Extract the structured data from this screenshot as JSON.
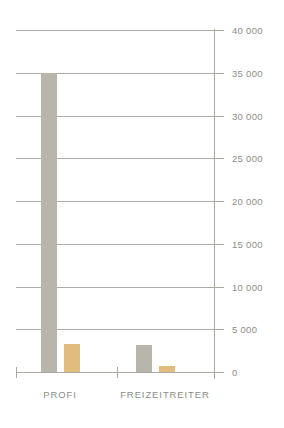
{
  "chart_data": {
    "type": "bar",
    "title": "",
    "subtitle": "",
    "xlabel": "",
    "ylabel": "",
    "categories": [
      "PROFI",
      "FREIZEITREITER"
    ],
    "series": [
      {
        "name": "series-1",
        "color": "#b8b5ad",
        "values": [
          35000,
          3200
        ]
      },
      {
        "name": "series-2",
        "color": "#e0bc7e",
        "values": [
          3300,
          700
        ]
      }
    ],
    "ylim": [
      0,
      40000
    ],
    "y_ticks": [
      0,
      5000,
      10000,
      15000,
      20000,
      25000,
      30000,
      35000,
      40000
    ],
    "y_tick_labels": [
      "0",
      "5 000",
      "10 000",
      "15 000",
      "20 000",
      "25 000",
      "30 000",
      "35 000",
      "40 000"
    ],
    "grid": true,
    "grid_axis": "y",
    "legend": false,
    "legend_position": "none",
    "axis_position": "right",
    "colors": {
      "background": "#ffffff",
      "grid": "#a9a9a2",
      "axis": "#a9a9a2",
      "tick_label": "#8d8d86",
      "category_label": "#8d8d86"
    }
  }
}
